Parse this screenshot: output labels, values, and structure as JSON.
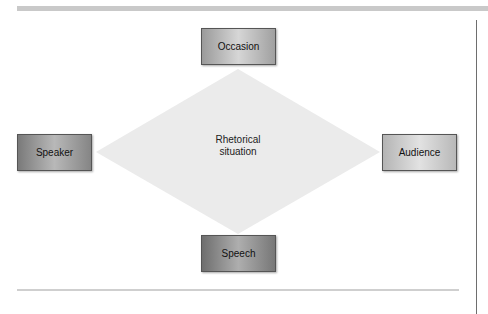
{
  "diagram": {
    "center": {
      "label": "Rhetorical situation",
      "line1": "Rhetorical",
      "line2": "situation",
      "fill": "#ebebeb"
    },
    "nodes": [
      {
        "id": "occasion",
        "label": "Occasion",
        "position": "top"
      },
      {
        "id": "speaker",
        "label": "Speaker",
        "position": "left"
      },
      {
        "id": "audience",
        "label": "Audience",
        "position": "right"
      },
      {
        "id": "speech",
        "label": "Speech",
        "position": "bottom"
      }
    ]
  }
}
